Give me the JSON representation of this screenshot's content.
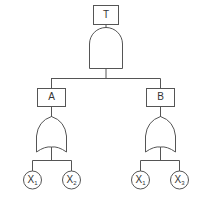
{
  "diagram": {
    "type": "fault-tree",
    "stroke_color": "#555555",
    "top_event": {
      "label": "T",
      "gate": "AND"
    },
    "intermediate_events": [
      {
        "label": "A",
        "gate": "OR",
        "inputs": [
          {
            "base": "X",
            "sub": "1"
          },
          {
            "base": "X",
            "sub": "2"
          }
        ]
      },
      {
        "label": "B",
        "gate": "OR",
        "inputs": [
          {
            "base": "X",
            "sub": "1"
          },
          {
            "base": "X",
            "sub": "3"
          }
        ]
      }
    ]
  }
}
